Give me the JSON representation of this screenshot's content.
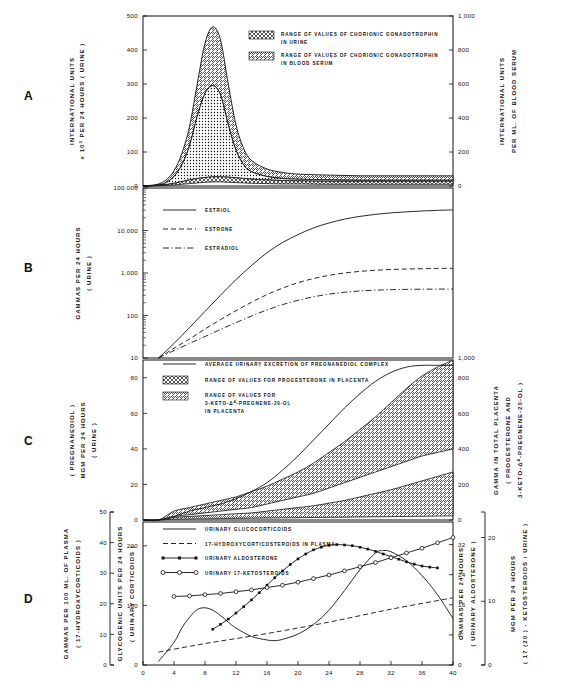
{
  "figure": {
    "title": "",
    "xaxis": {
      "label": "",
      "ticks": [
        0,
        4,
        8,
        12,
        16,
        20,
        24,
        28,
        32,
        36,
        40
      ],
      "min": 0,
      "max": 40
    },
    "panel_letters": [
      "A",
      "B",
      "C",
      "D"
    ]
  },
  "panelA": {
    "letter": "A",
    "left_axis": {
      "line1": "INTERNATIONAL UNITS",
      "line2": "x 10",
      "line2_sup": "3",
      "line2_rest": " PER 24 HOURS ( URINE )",
      "ticks": [
        0,
        100,
        200,
        300,
        400,
        500
      ],
      "min": 0,
      "max": 500
    },
    "right_axis": {
      "line1": "INTERNATIONAL UNITS",
      "line2": "PER ML. OF BLOOD SERUM",
      "ticks": [
        "0",
        "200",
        "400",
        "600",
        "800",
        "1,000"
      ],
      "min": 0,
      "max": 1000
    },
    "legend": [
      {
        "swatch": "crosshatch",
        "line1": "RANGE OF VALUES OF CHORIONIC GONADOTROPHIN",
        "line2": "IN URINE"
      },
      {
        "swatch": "diagonal",
        "line1": "RANGE OF VALUES OF CHORIONIC GONADOTROPHIN",
        "line2": "IN BLOOD SERUM"
      }
    ]
  },
  "panelB": {
    "letter": "B",
    "left_axis": {
      "line1": "GAMMAS PER 24 HOURS",
      "line2": "( URINE )",
      "ticks": [
        "10",
        "100",
        "1,000",
        "10,000",
        "100,000"
      ],
      "scale": "log10",
      "min": 10,
      "max": 100000
    },
    "right_axis": {
      "ticks": [
        "1,000"
      ]
    },
    "legend": [
      {
        "style": "solid",
        "label": "ESTRIOL"
      },
      {
        "style": "dashed",
        "label": "ESTRONE"
      },
      {
        "style": "dashdot",
        "label": "ESTRADIOL"
      }
    ]
  },
  "panelC": {
    "letter": "C",
    "left_axis": {
      "line1": "MGM PER 24 HOURS",
      "line2": "( URINE )",
      "line3": "( PREGNANEDIOL )",
      "ticks": [
        0,
        20,
        40,
        60,
        80
      ],
      "min": 0,
      "max": 90
    },
    "right_axis": {
      "line1": "GAMMA IN TOTAL PLACENTA",
      "line2": "( PROGESTERONE AND",
      "line3": "3-KETO-",
      "line3_delta": "Δ",
      "line3_sup": "4",
      "line3_rest": "-PREGNENE-20-OL )",
      "ticks": [
        0,
        200,
        400,
        600,
        800
      ],
      "min": 0,
      "max": 900
    },
    "legend": [
      {
        "style": "solid",
        "line1": "AVERAGE URINARY EXCRETION OF PREGNANEDIOL COMPLEX"
      },
      {
        "swatch": "crosshatch",
        "line1": "RANGE OF VALUES FOR PROGESTERONE IN PLACENTA"
      },
      {
        "swatch": "diagonal",
        "line1": "RANGE OF VALUES FOR",
        "line2_pre": "3-KETO-",
        "line2_delta": "Δ",
        "line2_sup": "4",
        "line2_rest": "-PREGNENE-20-OL",
        "line3": "IN PLACENTA"
      }
    ]
  },
  "panelD": {
    "letter": "D",
    "left_axis_outer": {
      "line1": "GAMMAS PER 100 ML. OF PLASMA",
      "line2": "( 17-HYDROXYCORTICOIDS )",
      "ticks": [
        0,
        10,
        20,
        30,
        40,
        50
      ],
      "min": 0,
      "max": 50
    },
    "left_axis_inner": {
      "line1": "GLYCOGENIC UNITS PER 24 HOURS",
      "line2": "( URINARY CORTICOIDS )",
      "ticks": [
        0,
        100,
        200
      ],
      "min": 0,
      "max": 240
    },
    "right_axis_inner": {
      "line1": "GAMMAS PER 24 HOURS",
      "line2": "( URINARY ALDOSTERONE )",
      "ticks": [
        0,
        8,
        16,
        24,
        32
      ],
      "min": 0,
      "max": 38
    },
    "right_axis_outer": {
      "line1": "MGM PER 24 HOURS",
      "line2": "( 17 (20 ) - KETOSTEROIDS / URINE )",
      "ticks": [
        0,
        10,
        20
      ],
      "min": 0,
      "max": 24
    },
    "legend": [
      {
        "style": "solid",
        "label": "URINARY GLUCOCORTICOIDS"
      },
      {
        "style": "dashed",
        "label": "17-HYDROXYCORTICOSTEROIDS IN PLASMA"
      },
      {
        "style": "marker-square",
        "label": "URINARY ALDOSTERONE"
      },
      {
        "style": "marker-circle",
        "label": "URINARY 17-KETOSTEROIDS"
      }
    ]
  },
  "chart_data": [
    {
      "id": "A",
      "type": "area",
      "title": "Chorionic gonadotrophin through gestation",
      "xlabel": "WEEKS OF GESTATION",
      "ylabel": "INTERNATIONAL UNITS x 10^3 PER 24 HOURS ( URINE )",
      "y2label": "INTERNATIONAL UNITS PER ML. OF BLOOD SERUM",
      "xlim": [
        0,
        40
      ],
      "ylim": [
        0,
        500
      ],
      "y2lim": [
        0,
        1000
      ],
      "grid": false,
      "legend_position": "upper-center",
      "x": [
        0,
        1,
        2,
        3,
        4,
        5,
        6,
        7,
        8,
        9,
        10,
        11,
        12,
        13,
        14,
        16,
        18,
        20,
        24,
        28,
        32,
        36,
        40
      ],
      "series": [
        {
          "name": "Chorionic gonadotrophin in urine - upper bound",
          "values": [
            0,
            2,
            6,
            18,
            45,
            95,
            175,
            300,
            420,
            468,
            430,
            300,
            180,
            110,
            75,
            50,
            40,
            35,
            32,
            30,
            30,
            30,
            30
          ]
        },
        {
          "name": "Chorionic gonadotrophin in urine - lower bound",
          "values": [
            0,
            1,
            3,
            10,
            28,
            62,
            118,
            205,
            272,
            295,
            268,
            180,
            105,
            62,
            42,
            28,
            22,
            20,
            18,
            17,
            17,
            17,
            17
          ]
        },
        {
          "name": "Chorionic gonadotrophin in blood serum - upper bound",
          "values": [
            0,
            1,
            2,
            4,
            8,
            13,
            18,
            22,
            25,
            27,
            27,
            26,
            24,
            22,
            20,
            18,
            16,
            15,
            14,
            14,
            14,
            14,
            14
          ]
        },
        {
          "name": "Chorionic gonadotrophin in blood serum - lower bound",
          "values": [
            0,
            0,
            1,
            2,
            3,
            5,
            7,
            9,
            11,
            12,
            12,
            11,
            10,
            9,
            8,
            7,
            6,
            6,
            5,
            5,
            5,
            5,
            5
          ]
        }
      ]
    },
    {
      "id": "B",
      "type": "line",
      "title": "Urinary oestrogens through gestation (log scale)",
      "xlabel": "WEEKS OF GESTATION",
      "ylabel": "GAMMAS PER 24 HOURS ( URINE )",
      "xlim": [
        0,
        40
      ],
      "ylim": [
        10,
        100000
      ],
      "yscale": "log",
      "grid": false,
      "legend_position": "upper-left",
      "x": [
        2,
        4,
        6,
        8,
        10,
        12,
        14,
        16,
        18,
        20,
        22,
        24,
        26,
        28,
        30,
        32,
        34,
        36,
        38,
        40
      ],
      "series": [
        {
          "name": "ESTRIOL",
          "style": "solid",
          "values": [
            10,
            22,
            52,
            125,
            300,
            700,
            1500,
            3000,
            5200,
            8000,
            11500,
            15000,
            18500,
            21500,
            24000,
            26000,
            27500,
            28800,
            29800,
            30500
          ]
        },
        {
          "name": "ESTRONE",
          "style": "dashed",
          "values": [
            10,
            17,
            28,
            48,
            80,
            130,
            205,
            310,
            440,
            590,
            740,
            880,
            1000,
            1090,
            1160,
            1210,
            1240,
            1260,
            1280,
            1290
          ]
        },
        {
          "name": "ESTRADIOL",
          "style": "dashdot",
          "values": [
            10,
            15,
            22,
            32,
            47,
            68,
            97,
            135,
            180,
            228,
            275,
            318,
            352,
            378,
            395,
            405,
            412,
            416,
            418,
            420
          ]
        }
      ]
    },
    {
      "id": "C",
      "type": "area",
      "title": "Pregnanediol and placental progesterone",
      "xlabel": "WEEKS OF GESTATION",
      "ylabel": "MGM PER 24 HOURS ( URINE ) ( PREGNANEDIOL )",
      "y2label": "GAMMA IN TOTAL PLACENTA ( PROGESTERONE AND 3-KETO-D4-PREGNENE-20-OL )",
      "xlim": [
        0,
        40
      ],
      "ylim": [
        0,
        90
      ],
      "y2lim": [
        0,
        900
      ],
      "grid": false,
      "legend_position": "upper-left",
      "x": [
        0,
        2,
        4,
        6,
        8,
        10,
        12,
        14,
        16,
        18,
        20,
        22,
        24,
        26,
        28,
        30,
        32,
        34,
        36,
        38,
        40
      ],
      "series": [
        {
          "name": "AVERAGE URINARY EXCRETION OF PREGNANEDIOL COMPLEX",
          "style": "solid",
          "values": [
            0,
            0,
            2,
            5,
            7,
            9,
            12,
            16,
            21,
            28,
            36,
            45,
            54,
            63,
            71,
            78,
            83,
            86,
            87,
            87,
            87
          ]
        },
        {
          "name": "Progesterone in placenta - upper bound",
          "values": [
            0,
            0,
            5,
            7,
            9,
            11,
            13,
            16,
            19,
            23,
            27,
            32,
            38,
            44,
            51,
            58,
            66,
            74,
            81,
            86,
            90
          ]
        },
        {
          "name": "Progesterone in placenta - lower bound",
          "values": [
            0,
            0,
            2,
            3,
            4,
            5,
            6,
            7,
            9,
            11,
            13,
            15,
            18,
            21,
            24,
            27,
            30,
            33,
            36,
            38,
            40
          ]
        },
        {
          "name": "3-KETO-D4-PREGNENE-20-OL in placenta - upper bound",
          "values": [
            0,
            0,
            1.5,
            2,
            2.5,
            3,
            3.5,
            4,
            5,
            6,
            7,
            8,
            9.5,
            11,
            13,
            15,
            17,
            19.5,
            22,
            24.5,
            27
          ]
        },
        {
          "name": "3-KETO-D4-PREGNENE-20-OL in placenta - lower bound",
          "values": [
            0,
            0,
            0.5,
            0.6,
            0.7,
            0.8,
            0.9,
            1,
            1.1,
            1.2,
            1.3,
            1.4,
            1.5,
            1.6,
            1.7,
            1.8,
            1.9,
            2,
            2.1,
            2.2,
            2.3
          ]
        }
      ]
    },
    {
      "id": "D",
      "type": "line",
      "title": "Corticosteroids, aldosterone and 17-ketosteroids through gestation",
      "xlabel": "WEEKS OF GESTATION",
      "ylabel": "GLYCOGENIC UNITS PER 24 HOURS ( URINARY CORTICOIDS )",
      "y2label": "GAMMAS PER 24 HOURS ( URINARY ALDOSTERONE )",
      "xlim": [
        0,
        40
      ],
      "ylim": [
        0,
        240
      ],
      "grid": false,
      "legend_position": "upper-left",
      "series": [
        {
          "name": "URINARY GLUCOCORTICOIDS",
          "style": "solid",
          "axis": "left-inner",
          "x": [
            2,
            4,
            5,
            6,
            7,
            8,
            9,
            10,
            11,
            12,
            14,
            16,
            17,
            18,
            20,
            22,
            24,
            26,
            28,
            30,
            31,
            32,
            34,
            36,
            38,
            40
          ],
          "values": [
            6,
            38,
            62,
            80,
            93,
            96,
            92,
            83,
            72,
            62,
            48,
            42,
            41,
            43,
            52,
            68,
            92,
            125,
            160,
            188,
            192,
            190,
            175,
            150,
            118,
            78
          ]
        },
        {
          "name": "17-HYDROXYCORTICOSTEROIDS IN PLASMA",
          "style": "dashed",
          "axis": "left-outer",
          "x": [
            2,
            8,
            16,
            24,
            32,
            40
          ],
          "values": [
            4.5,
            7.5,
            11,
            15,
            19.5,
            23.5
          ]
        },
        {
          "name": "URINARY ALDOSTERONE",
          "style": "marker-square",
          "axis": "right-inner",
          "x": [
            9,
            10,
            11,
            12,
            13,
            14,
            15,
            16,
            17,
            18,
            19,
            20,
            21,
            22,
            23,
            24,
            25,
            26,
            27,
            28,
            29,
            30,
            31,
            32,
            33,
            34,
            35,
            36,
            37,
            38
          ],
          "values": [
            9.5,
            10.8,
            12.2,
            13.8,
            15.5,
            17.3,
            19.2,
            21.2,
            23.2,
            25.0,
            26.7,
            28.2,
            29.5,
            30.6,
            31.3,
            31.8,
            32.0,
            31.9,
            31.7,
            31.3,
            30.8,
            30.2,
            29.5,
            28.8,
            28.1,
            27.4,
            26.8,
            26.3,
            26.0,
            25.8
          ]
        },
        {
          "name": "URINARY 17-KETOSTEROIDS",
          "style": "marker-circle",
          "axis": "right-outer",
          "x": [
            4,
            6,
            8,
            10,
            12,
            14,
            16,
            18,
            20,
            22,
            24,
            26,
            28,
            30,
            32,
            34,
            36,
            38,
            40
          ],
          "values": [
            11.5,
            11.6,
            11.8,
            12.0,
            12.3,
            12.6,
            13.0,
            13.4,
            13.9,
            14.5,
            15.1,
            15.8,
            16.5,
            17.2,
            18.0,
            18.8,
            19.6,
            20.5,
            21.4
          ]
        }
      ]
    }
  ]
}
